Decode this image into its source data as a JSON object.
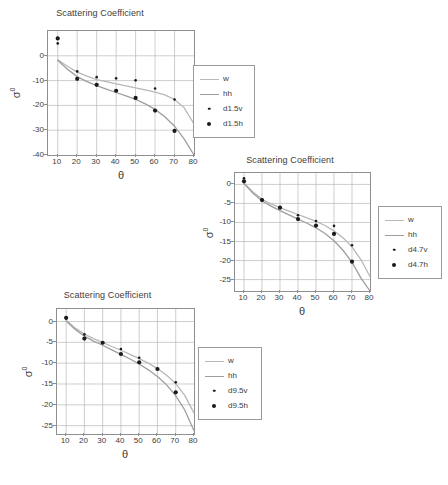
{
  "figure": {
    "background": "#ffffff",
    "axis_color": "#8f8f8f",
    "grid_color": "#b9b9b9",
    "text_color": "#3d3d3d",
    "marker_color": "#1a1a1a",
    "curve_w_color": "#b8b8b8",
    "curve_hh_color": "#9e9e9e"
  },
  "panels": [
    {
      "id": "panel-1-5cm",
      "chart_data": {
        "type": "scatter",
        "title": "Scattering Coefficient",
        "xlabel": "θ",
        "ylabel": "σ⁰",
        "xlim": [
          5,
          80
        ],
        "ylim": [
          -40,
          10
        ],
        "xticks": [
          10,
          20,
          30,
          40,
          50,
          60,
          70,
          80
        ],
        "yticks": [
          0,
          -10,
          -20,
          -30,
          -40
        ],
        "xtick_labels": [
          "10",
          "20",
          "30",
          "40",
          "50",
          "60",
          "70",
          "80"
        ],
        "ytick_labels": [
          "0",
          "-10",
          "-20",
          "-30",
          "-40"
        ],
        "grid": true,
        "legend_position": "right",
        "series": [
          {
            "name": "w",
            "kind": "line",
            "color": "#b8b8b8",
            "x": [
              10,
              15,
              20,
              25,
              30,
              35,
              40,
              45,
              50,
              55,
              60,
              65,
              70,
              75,
              80
            ],
            "y": [
              -1.6,
              -4.2,
              -6.6,
              -8.2,
              -9.6,
              -10.4,
              -11.3,
              -12.1,
              -12.9,
              -13.7,
              -14.6,
              -15.8,
              -17.6,
              -21.0,
              -27.5
            ]
          },
          {
            "name": "hh",
            "kind": "line",
            "color": "#9e9e9e",
            "x": [
              10,
              15,
              20,
              25,
              30,
              35,
              40,
              45,
              50,
              55,
              60,
              65,
              70,
              75,
              80
            ],
            "y": [
              -1.8,
              -5.4,
              -8.4,
              -10.4,
              -12.0,
              -13.4,
              -14.8,
              -16.2,
              -17.6,
              -19.4,
              -21.6,
              -24.6,
              -28.4,
              -33.6,
              -40.0
            ]
          },
          {
            "name": "d1.5v",
            "kind": "markers",
            "marker": "small-dot",
            "color": "#1a1a1a",
            "x": [
              10,
              20,
              30,
              40,
              50,
              60,
              70
            ],
            "y": [
              5.0,
              -6.3,
              -8.6,
              -9.1,
              -9.9,
              -13.2,
              -17.6
            ]
          },
          {
            "name": "d1.5h",
            "kind": "markers",
            "marker": "large-dot",
            "color": "#1a1a1a",
            "x": [
              10,
              20,
              30,
              40,
              50,
              60,
              70
            ],
            "y": [
              7.0,
              -9.3,
              -11.7,
              -14.1,
              -17.0,
              -22.1,
              -30.3
            ]
          }
        ],
        "legend": [
          {
            "label": "w",
            "kind": "line",
            "color": "#b8b8b8"
          },
          {
            "label": "hh",
            "kind": "line",
            "color": "#9e9e9e"
          },
          {
            "label": "d1.5v",
            "kind": "small-dot",
            "color": "#1a1a1a"
          },
          {
            "label": "d1.5h",
            "kind": "large-dot",
            "color": "#1a1a1a"
          }
        ]
      }
    },
    {
      "id": "panel-4-7cm",
      "chart_data": {
        "type": "scatter",
        "title": "Scattering Coefficient",
        "xlabel": "θ",
        "ylabel": "σ⁰",
        "xlim": [
          5,
          80
        ],
        "ylim": [
          -28,
          3
        ],
        "xticks": [
          10,
          20,
          30,
          40,
          50,
          60,
          70,
          80
        ],
        "yticks": [
          0,
          -5,
          -10,
          -15,
          -20,
          -25
        ],
        "xtick_labels": [
          "10",
          "20",
          "30",
          "40",
          "50",
          "60",
          "70",
          "80"
        ],
        "ytick_labels": [
          "0",
          "-5",
          "-10",
          "-15",
          "-20",
          "-25"
        ],
        "grid": true,
        "legend_position": "right",
        "series": [
          {
            "name": "w",
            "kind": "line",
            "color": "#b8b8b8",
            "x": [
              10,
              15,
              20,
              25,
              30,
              35,
              40,
              45,
              50,
              55,
              60,
              65,
              70,
              75,
              80
            ],
            "y": [
              0.4,
              -2.0,
              -3.9,
              -5.1,
              -6.1,
              -7.0,
              -7.9,
              -8.8,
              -9.7,
              -10.8,
              -12.2,
              -14.0,
              -16.4,
              -19.8,
              -24.2
            ]
          },
          {
            "name": "hh",
            "kind": "line",
            "color": "#9e9e9e",
            "x": [
              10,
              15,
              20,
              25,
              30,
              35,
              40,
              45,
              50,
              55,
              60,
              65,
              70,
              75,
              80
            ],
            "y": [
              0.2,
              -2.3,
              -4.3,
              -5.7,
              -6.9,
              -8.0,
              -9.1,
              -10.2,
              -11.4,
              -12.9,
              -14.8,
              -17.3,
              -20.5,
              -24.6,
              -28.0
            ]
          },
          {
            "name": "d4.7v",
            "kind": "markers",
            "marker": "small-dot",
            "color": "#1a1a1a",
            "x": [
              10,
              20,
              30,
              40,
              50,
              60,
              70
            ],
            "y": [
              1.6,
              -4.0,
              -6.0,
              -8.1,
              -9.6,
              -10.9,
              -16.0
            ]
          },
          {
            "name": "d4.7h",
            "kind": "markers",
            "marker": "large-dot",
            "color": "#1a1a1a",
            "x": [
              10,
              20,
              30,
              40,
              50,
              60,
              70
            ],
            "y": [
              0.8,
              -4.1,
              -6.1,
              -9.1,
              -10.8,
              -13.0,
              -20.3
            ]
          }
        ],
        "legend": [
          {
            "label": "w",
            "kind": "line",
            "color": "#b8b8b8"
          },
          {
            "label": "hh",
            "kind": "line",
            "color": "#9e9e9e"
          },
          {
            "label": "d4.7v",
            "kind": "small-dot",
            "color": "#1a1a1a"
          },
          {
            "label": "d4.7h",
            "kind": "large-dot",
            "color": "#1a1a1a"
          }
        ]
      }
    },
    {
      "id": "panel-9-5cm",
      "chart_data": {
        "type": "scatter",
        "title": "Scattering Coefficient",
        "xlabel": "θ",
        "ylabel": "σ⁰",
        "xlim": [
          5,
          80
        ],
        "ylim": [
          -27,
          3
        ],
        "xticks": [
          10,
          20,
          30,
          40,
          50,
          60,
          70,
          80
        ],
        "yticks": [
          0,
          -5,
          -10,
          -15,
          -20,
          -25
        ],
        "xtick_labels": [
          "10",
          "20",
          "30",
          "40",
          "50",
          "60",
          "70",
          "80"
        ],
        "ytick_labels": [
          "0",
          "-5",
          "-10",
          "-15",
          "-20",
          "-25"
        ],
        "grid": true,
        "legend_position": "right",
        "series": [
          {
            "name": "w",
            "kind": "line",
            "color": "#b8b8b8",
            "x": [
              10,
              15,
              20,
              25,
              30,
              35,
              40,
              45,
              50,
              55,
              60,
              65,
              70,
              75,
              80
            ],
            "y": [
              0.3,
              -1.6,
              -3.0,
              -4.1,
              -5.0,
              -6.0,
              -6.9,
              -7.9,
              -8.9,
              -10.0,
              -11.3,
              -12.9,
              -14.9,
              -17.8,
              -22.0
            ]
          },
          {
            "name": "hh",
            "kind": "line",
            "color": "#9e9e9e",
            "x": [
              10,
              15,
              20,
              25,
              30,
              35,
              40,
              45,
              50,
              55,
              60,
              65,
              70,
              75,
              80
            ],
            "y": [
              0.1,
              -1.9,
              -3.5,
              -4.7,
              -5.7,
              -6.8,
              -7.9,
              -9.0,
              -10.2,
              -11.6,
              -13.2,
              -15.2,
              -17.8,
              -21.3,
              -26.2
            ]
          },
          {
            "name": "d9.5v",
            "kind": "markers",
            "marker": "small-dot",
            "color": "#1a1a1a",
            "x": [
              10,
              20,
              30,
              40,
              50,
              60,
              70
            ],
            "y": [
              0.7,
              -3.1,
              -5.1,
              -6.6,
              -8.7,
              -11.4,
              -14.6
            ]
          },
          {
            "name": "d9.5h",
            "kind": "markers",
            "marker": "large-dot",
            "color": "#1a1a1a",
            "x": [
              10,
              20,
              30,
              40,
              50,
              60,
              70
            ],
            "y": [
              0.9,
              -4.1,
              -5.1,
              -7.8,
              -9.8,
              -11.4,
              -17.0
            ]
          }
        ],
        "legend": [
          {
            "label": "w",
            "kind": "line",
            "color": "#b8b8b8"
          },
          {
            "label": "hh",
            "kind": "line",
            "color": "#9e9e9e"
          },
          {
            "label": "d9.5v",
            "kind": "small-dot",
            "color": "#1a1a1a"
          },
          {
            "label": "d9.5h",
            "kind": "large-dot",
            "color": "#1a1a1a"
          }
        ]
      }
    }
  ]
}
